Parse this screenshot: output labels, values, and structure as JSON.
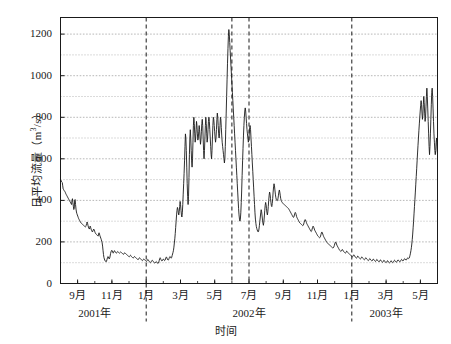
{
  "chart_data": {
    "type": "line",
    "title": "",
    "xlabel": "时间",
    "ylabel": "日平均流量（m³/s）",
    "ylim": [
      0,
      1280
    ],
    "yticks": [
      0,
      200,
      400,
      600,
      800,
      1000,
      1200
    ],
    "ytick_labels": [
      "0",
      "200",
      "400",
      "600",
      "800",
      "1000",
      "1200"
    ],
    "gridline_step": 100,
    "grid": true,
    "legend": null,
    "xtick_labels": [
      "9月",
      "11月",
      "1月",
      "3月",
      "5月",
      "7月",
      "9月",
      "11月",
      "1月",
      "3月",
      "5月"
    ],
    "xtick_months": [
      "2001-09",
      "2001-11",
      "2002-01",
      "2002-03",
      "2002-05",
      "2002-07",
      "2002-09",
      "2002-11",
      "2003-01",
      "2003-03",
      "2003-05"
    ],
    "year_labels": [
      {
        "text": "2001年",
        "at_month": "2001-10"
      },
      {
        "text": "2002年",
        "at_month": "2002-07"
      },
      {
        "text": "2003年",
        "at_month": "2003-03"
      }
    ],
    "vertical_dashed_lines": [
      {
        "label": "2002-01",
        "at_month": "2002-01"
      },
      {
        "label": "2002-06",
        "at_month": "2002-06"
      },
      {
        "label": "2002-07",
        "at_month": "2002-07"
      },
      {
        "label": "2003-01",
        "at_month": "2003-01"
      }
    ],
    "x_start": "2001-08",
    "x_end": "2003-06",
    "series": [
      {
        "name": "日平均流量",
        "color": "#1a1a1a",
        "values": [
          500,
          497,
          492,
          488,
          486,
          470,
          455,
          452,
          448,
          445,
          442,
          438,
          432,
          428,
          424,
          420,
          416,
          412,
          408,
          404,
          400,
          396,
          392,
          388,
          384,
          380,
          400,
          408,
          390,
          372,
          356,
          362,
          400,
          404,
          380,
          358,
          344,
          336,
          330,
          324,
          318,
          312,
          308,
          304,
          300,
          296,
          292,
          290,
          288,
          286,
          284,
          282,
          280,
          278,
          276,
          274,
          272,
          274,
          280,
          288,
          296,
          290,
          280,
          272,
          266,
          262,
          268,
          276,
          270,
          262,
          256,
          252,
          248,
          252,
          258,
          262,
          258,
          252,
          246,
          242,
          238,
          236,
          234,
          232,
          230,
          228,
          240,
          244,
          238,
          230,
          224,
          218,
          212,
          204,
          196,
          180,
          160,
          140,
          126,
          118,
          112,
          108,
          106,
          104,
          108,
          116,
          124,
          130,
          128,
          122,
          118,
          122,
          132,
          144,
          152,
          158,
          160,
          156,
          150,
          146,
          150,
          156,
          158,
          154,
          150,
          148,
          146,
          148,
          152,
          154,
          152,
          150,
          148,
          146,
          148,
          150,
          152,
          150,
          148,
          146,
          144,
          142,
          140,
          142,
          146,
          148,
          146,
          144,
          142,
          140,
          138,
          136,
          134,
          132,
          130,
          128,
          130,
          134,
          136,
          134,
          130,
          128,
          126,
          124,
          122,
          124,
          128,
          130,
          128,
          126,
          124,
          122,
          120,
          118,
          116,
          114,
          116,
          120,
          124,
          122,
          120,
          118,
          116,
          114,
          112,
          110,
          112,
          116,
          118,
          116,
          114,
          112,
          110,
          108,
          106,
          108,
          112,
          116,
          114,
          110,
          106,
          104,
          102,
          100,
          102,
          106,
          110,
          112,
          110,
          106,
          104,
          102,
          100,
          98,
          100,
          104,
          106,
          104,
          100,
          98,
          96,
          98,
          104,
          112,
          120,
          124,
          120,
          114,
          110,
          108,
          110,
          114,
          118,
          116,
          112,
          110,
          112,
          118,
          124,
          128,
          124,
          118,
          114,
          112,
          114,
          120,
          126,
          130,
          128,
          124,
          122,
          126,
          134,
          142,
          150,
          160,
          175,
          195,
          215,
          240,
          270,
          300,
          330,
          352,
          366,
          358,
          340,
          330,
          345,
          370,
          395,
          380,
          352,
          330,
          320,
          340,
          380,
          430,
          480,
          530,
          590,
          660,
          720,
          700,
          640,
          560,
          480,
          420,
          380,
          420,
          510,
          620,
          700,
          740,
          700,
          640,
          590,
          560,
          600,
          680,
          760,
          800,
          770,
          720,
          680,
          700,
          740,
          780,
          760,
          720,
          690,
          700,
          730,
          760,
          740,
          700,
          670,
          690,
          730,
          770,
          790,
          760,
          700,
          640,
          600,
          640,
          700,
          760,
          800,
          770,
          720,
          680,
          700,
          740,
          780,
          800,
          780,
          740,
          700,
          660,
          620,
          600,
          640,
          700,
          760,
          800,
          790,
          760,
          730,
          700,
          680,
          700,
          740,
          790,
          820,
          800,
          760,
          720,
          700,
          720,
          760,
          800,
          790,
          750,
          710,
          680,
          660,
          640,
          620,
          600,
          580,
          600,
          660,
          740,
          820,
          900,
          980,
          1060,
          1130,
          1190,
          1222,
          1200,
          1160,
          1120,
          1080,
          1040,
          1000,
          960,
          920,
          880,
          840,
          800,
          760,
          720,
          680,
          640,
          600,
          560,
          520,
          480,
          440,
          400,
          360,
          330,
          310,
          300,
          310,
          340,
          390,
          450,
          520,
          590,
          650,
          710,
          760,
          800,
          830,
          845,
          830,
          800,
          770,
          740,
          720,
          700,
          680,
          690,
          720,
          750,
          760,
          740,
          700,
          660,
          620,
          580,
          540,
          500,
          460,
          420,
          380,
          340,
          310,
          290,
          275,
          265,
          258,
          252,
          248,
          250,
          262,
          280,
          300,
          320,
          340,
          355,
          345,
          325,
          305,
          290,
          280,
          295,
          320,
          350,
          375,
          390,
          380,
          360,
          340,
          330,
          345,
          370,
          400,
          425,
          440,
          430,
          410,
          390,
          375,
          370,
          385,
          410,
          440,
          465,
          480,
          470,
          450,
          430,
          415,
          405,
          400,
          398,
          400,
          410,
          425,
          440,
          450,
          440,
          425,
          410,
          400,
          395,
          390,
          388,
          386,
          384,
          382,
          380,
          378,
          376,
          374,
          372,
          370,
          368,
          366,
          364,
          362,
          360,
          356,
          352,
          348,
          344,
          340,
          336,
          332,
          328,
          324,
          320,
          318,
          322,
          330,
          338,
          342,
          338,
          330,
          322,
          316,
          312,
          308,
          304,
          300,
          296,
          292,
          290,
          288,
          286,
          284,
          282,
          280,
          278,
          280,
          286,
          294,
          302,
          308,
          306,
          300,
          294,
          288,
          284,
          280,
          276,
          272,
          268,
          264,
          260,
          256,
          252,
          250,
          254,
          262,
          270,
          276,
          274,
          268,
          262,
          256,
          252,
          248,
          244,
          240,
          236,
          232,
          228,
          226,
          224,
          222,
          220,
          222,
          228,
          236,
          244,
          248,
          244,
          238,
          232,
          226,
          222,
          218,
          214,
          210,
          206,
          202,
          198,
          196,
          194,
          192,
          190,
          188,
          186,
          184,
          182,
          180,
          178,
          176,
          174,
          172,
          170,
          172,
          176,
          182,
          190,
          196,
          200,
          196,
          190,
          184,
          180,
          176,
          172,
          168,
          164,
          160,
          158,
          156,
          154,
          156,
          160,
          164,
          162,
          158,
          154,
          152,
          150,
          148,
          146,
          148,
          152,
          156,
          154,
          150,
          148,
          146,
          144,
          142,
          140,
          138,
          136,
          134,
          132,
          130,
          128,
          130,
          134,
          138,
          136,
          132,
          128,
          126,
          124,
          122,
          124,
          128,
          132,
          130,
          126,
          124,
          122,
          120,
          118,
          120,
          124,
          128,
          126,
          122,
          120,
          118,
          116,
          114,
          116,
          120,
          124,
          122,
          118,
          116,
          114,
          112,
          110,
          112,
          116,
          120,
          118,
          114,
          112,
          110,
          108,
          110,
          114,
          118,
          116,
          112,
          110,
          108,
          106,
          108,
          112,
          116,
          114,
          110,
          108,
          106,
          104,
          106,
          110,
          114,
          112,
          108,
          106,
          104,
          102,
          104,
          108,
          112,
          110,
          106,
          104,
          102,
          100,
          102,
          106,
          110,
          108,
          104,
          102,
          100,
          100,
          102,
          106,
          110,
          108,
          104,
          102,
          100,
          102,
          106,
          110,
          112,
          110,
          106,
          104,
          102,
          104,
          108,
          112,
          114,
          112,
          108,
          106,
          104,
          106,
          110,
          114,
          116,
          114,
          110,
          108,
          110,
          114,
          118,
          120,
          118,
          114,
          112,
          114,
          118,
          122,
          124,
          122,
          120,
          122,
          128,
          136,
          146,
          158,
          172,
          190,
          212,
          238,
          268,
          300,
          335,
          370,
          405,
          440,
          478,
          515,
          552,
          590,
          628,
          665,
          700,
          735,
          768,
          800,
          830,
          858,
          880,
          860,
          820,
          790,
          810,
          860,
          900,
          870,
          820,
          780,
          800,
          850,
          900,
          940,
          900,
          840,
          780,
          720,
          660,
          620,
          660,
          720,
          790,
          860,
          920,
          940,
          900,
          840,
          780,
          720,
          680,
          640,
          620,
          640,
          680,
          700,
          660,
          620
        ]
      }
    ]
  },
  "axes": {
    "y_axis_name": "vertical-axis",
    "x_axis_name": "horizontal-axis"
  }
}
